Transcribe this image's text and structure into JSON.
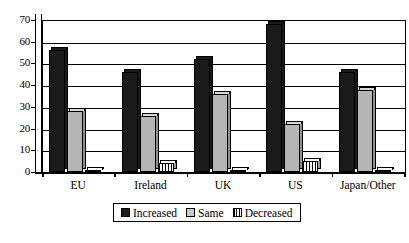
{
  "chart_data": {
    "type": "bar",
    "title": "",
    "subtitle": "",
    "xlabel": "",
    "ylabel": "",
    "ylim": [
      0,
      70
    ],
    "ytick_step": 10,
    "yticks": [
      0,
      10,
      20,
      30,
      40,
      50,
      60,
      70
    ],
    "ytick_labels": [
      "0",
      "10",
      "20",
      "30",
      "40",
      "50",
      "60",
      "70"
    ],
    "grid": true,
    "grid_axis": "y",
    "legend_position": "bottom",
    "orientation": "vertical",
    "grouping": "grouped",
    "style": "3d-bars",
    "categories": [
      "EU",
      "Ireland",
      "UK",
      "US",
      "Japan/Other"
    ],
    "series": [
      {
        "name": "Increased",
        "color": "#1a1a1a",
        "pattern": "solid",
        "values": [
          56,
          46,
          52,
          68,
          46
        ]
      },
      {
        "name": "Same",
        "color": "#b5b5b5",
        "pattern": "solid",
        "values": [
          28,
          26,
          36,
          22,
          38
        ]
      },
      {
        "name": "Decreased",
        "color": "#ffffff",
        "pattern": "vertical-hatch",
        "values": [
          1,
          4,
          1,
          5,
          1
        ]
      }
    ]
  },
  "axes": {
    "y_tick_labels": [
      "70",
      "60",
      "50",
      "40",
      "30",
      "20",
      "10",
      "0"
    ],
    "x_tick_labels": [
      "EU",
      "Ireland",
      "UK",
      "US",
      "Japan/Other"
    ]
  },
  "legend": {
    "items": [
      {
        "label": "Increased",
        "swatch": "increased"
      },
      {
        "label": "Same",
        "swatch": "same"
      },
      {
        "label": "Decreased",
        "swatch": "decreased"
      }
    ]
  },
  "colors": {
    "background": "#ffffff",
    "foreground": "#000000",
    "series_increased": "#1a1a1a",
    "series_same": "#b5b5b5",
    "series_decreased": "#ffffff"
  }
}
